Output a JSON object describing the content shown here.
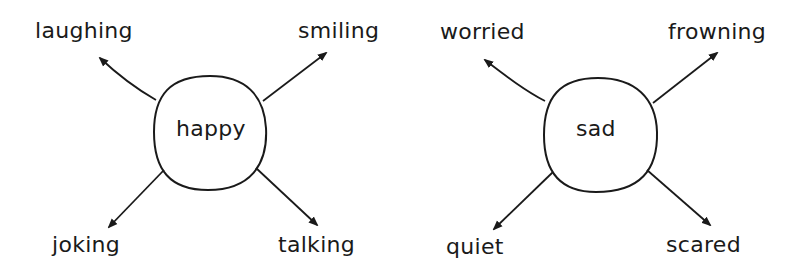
{
  "diagrams": [
    {
      "center": "happy",
      "branches": [
        {
          "label": "laughing",
          "position": "top-left"
        },
        {
          "label": "smiling",
          "position": "top-right"
        },
        {
          "label": "joking",
          "position": "bottom-left"
        },
        {
          "label": "talking",
          "position": "bottom-right"
        }
      ]
    },
    {
      "center": "sad",
      "branches": [
        {
          "label": "worried",
          "position": "top-left"
        },
        {
          "label": "frowning",
          "position": "top-right"
        },
        {
          "label": "quiet",
          "position": "bottom-left"
        },
        {
          "label": "scared",
          "position": "bottom-right"
        }
      ]
    }
  ],
  "colors": {
    "stroke": "#1a1a1a",
    "background": "#ffffff"
  }
}
